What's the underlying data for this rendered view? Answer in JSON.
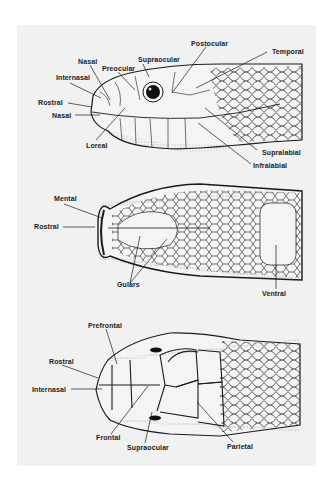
{
  "figure": {
    "background": "#f1f1f1",
    "line_color": "#1a1a1a",
    "views": [
      {
        "name": "lateral-view",
        "labels": {
          "postocular": "Postocular",
          "temporal": "Temporal",
          "nasal_top": "Nasal",
          "supraocular": "Supraocular",
          "preocular": "Preocular",
          "internasal": "Internasal",
          "rostral": "Rostral",
          "nasal": "Nasal",
          "loreal": "Loreal",
          "supralabial": "Supralabial",
          "infralabial": "Infralabial"
        }
      },
      {
        "name": "ventral-view",
        "labels": {
          "mental": "Mental",
          "rostral": "Rostral",
          "gulars": "Gulars",
          "ventral": "Ventral"
        }
      },
      {
        "name": "dorsal-view",
        "labels": {
          "prefrontal": "Prefrontal",
          "rostral": "Rostral",
          "internasal": "Internasal",
          "frontal": "Frontal",
          "supraocular": "Supraocular",
          "parietal": "Parietal"
        }
      }
    ]
  }
}
